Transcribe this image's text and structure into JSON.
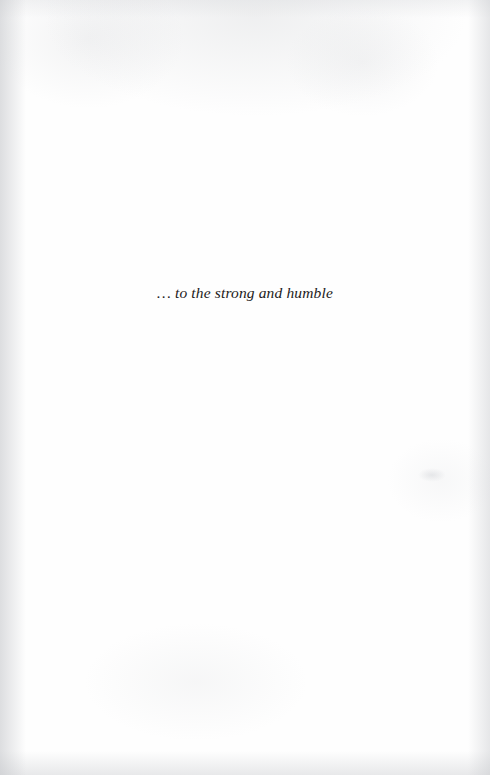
{
  "page": {
    "kind": "book-dedication-page",
    "background_color": "#fefefe",
    "edge_shadow_color": "#c1c3c7"
  },
  "dedication": {
    "text": "… to the strong and humble",
    "text_color": "#1c1a1a",
    "style": "italic-serif",
    "alignment": "center"
  }
}
